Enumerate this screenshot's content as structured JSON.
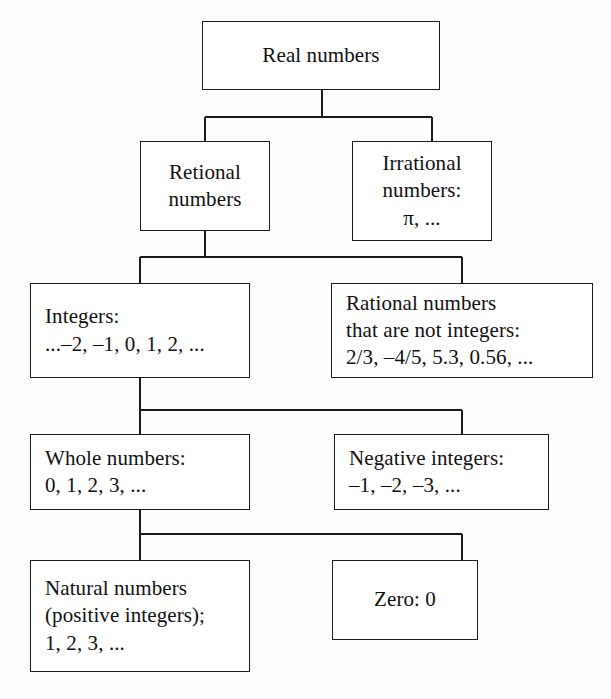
{
  "diagram": {
    "type": "hierarchy-tree",
    "line_color": "#1b1b1b",
    "box_fill": "#ffffff",
    "text_color": "#111111",
    "nodes": [
      {
        "id": "real-numbers",
        "lines": [
          "Real numbers"
        ],
        "align": "center",
        "x": 202,
        "y": 21,
        "w": 238,
        "h": 69
      },
      {
        "id": "rational-numbers",
        "lines": [
          "Retional",
          "numbers"
        ],
        "align": "center",
        "x": 140,
        "y": 141,
        "w": 130,
        "h": 90
      },
      {
        "id": "irrational-numbers",
        "lines": [
          "Irrational",
          "numbers:",
          "π, ..."
        ],
        "align": "center",
        "x": 352,
        "y": 141,
        "w": 140,
        "h": 100
      },
      {
        "id": "integers",
        "lines": [
          "Integers:",
          "...–2, –1, 0, 1, 2, ..."
        ],
        "align": "left",
        "x": 30,
        "y": 283,
        "w": 220,
        "h": 95
      },
      {
        "id": "rational-not-integers",
        "lines": [
          "Rational numbers",
          "that are not integers:",
          "2/3, –4/5, 5.3, 0.56, ..."
        ],
        "align": "left",
        "x": 331,
        "y": 283,
        "w": 262,
        "h": 95
      },
      {
        "id": "whole-numbers",
        "lines": [
          "Whole numbers:",
          "0, 1, 2, 3, ..."
        ],
        "align": "left",
        "x": 30,
        "y": 434,
        "w": 220,
        "h": 76
      },
      {
        "id": "negative-integers",
        "lines": [
          "Negative integers:",
          "–1, –2, –3, ..."
        ],
        "align": "left",
        "x": 334,
        "y": 434,
        "w": 215,
        "h": 76
      },
      {
        "id": "natural-numbers",
        "lines": [
          "Natural numbers",
          "(positive integers);",
          "1, 2, 3, ..."
        ],
        "align": "left",
        "x": 30,
        "y": 560,
        "w": 220,
        "h": 112
      },
      {
        "id": "zero",
        "lines": [
          "Zero: 0"
        ],
        "align": "center",
        "x": 332,
        "y": 560,
        "w": 146,
        "h": 80
      }
    ],
    "edges": [
      {
        "id": "real-to-children",
        "from": "real-numbers",
        "to": [
          "rational-numbers",
          "irrational-numbers"
        ]
      },
      {
        "id": "rational-to-children",
        "from": "rational-numbers",
        "to": [
          "integers",
          "rational-not-integers"
        ]
      },
      {
        "id": "integers-to-children",
        "from": "integers",
        "to": [
          "whole-numbers",
          "negative-integers"
        ]
      },
      {
        "id": "whole-to-children",
        "from": "whole-numbers",
        "to": [
          "natural-numbers",
          "zero"
        ]
      }
    ]
  }
}
